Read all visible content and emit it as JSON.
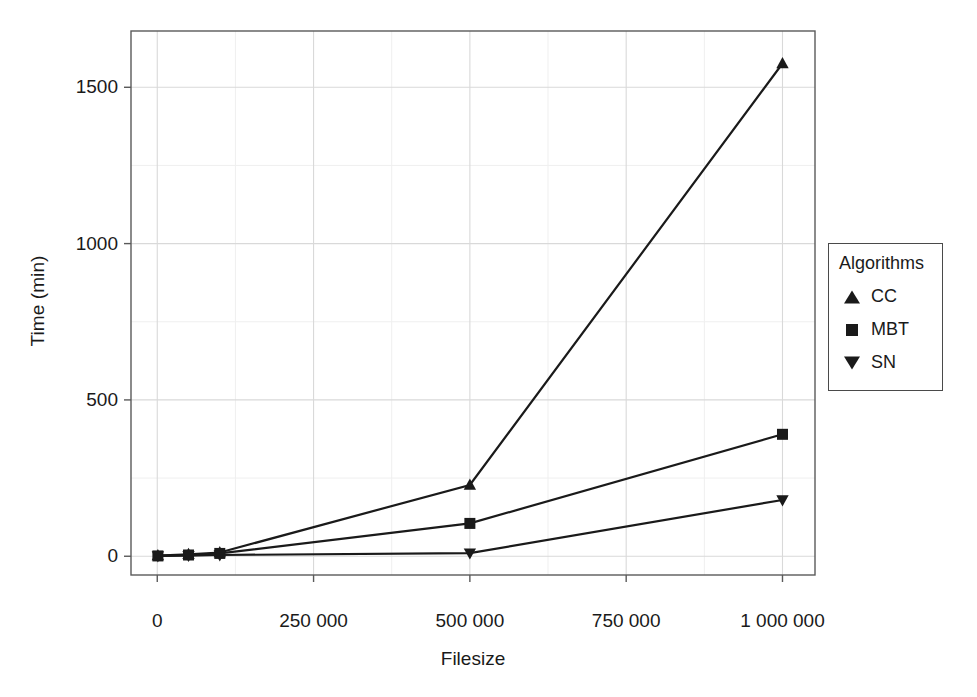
{
  "chart_data": {
    "type": "line",
    "title": "",
    "xlabel": "Filesize",
    "ylabel": "Time (min)",
    "xlim": [
      -42000,
      1052000
    ],
    "ylim": [
      -60,
      1680
    ],
    "xticks": [
      0,
      250000,
      500000,
      750000,
      1000000
    ],
    "xticklabels": [
      "0",
      "250 000",
      "500 000",
      "750 000",
      "1 000 000"
    ],
    "yticks": [
      0,
      500,
      1000,
      1500
    ],
    "yticklabels": [
      "0",
      "500",
      "1000",
      "1500"
    ],
    "grid": true,
    "grid_minor": true,
    "legend": {
      "title": "Algorithms",
      "position": "right",
      "entries": [
        {
          "label": "CC",
          "marker": "triangle-up-icon"
        },
        {
          "label": "MBT",
          "marker": "square-icon"
        },
        {
          "label": "SN",
          "marker": "triangle-down-icon"
        }
      ]
    },
    "x": [
      1000,
      50000,
      100000,
      500000,
      1000000
    ],
    "series": [
      {
        "name": "CC",
        "marker": "triangle-up",
        "color": "#1a1a1a",
        "values": [
          2,
          6,
          12,
          228,
          1576
        ]
      },
      {
        "name": "MBT",
        "marker": "square",
        "color": "#1a1a1a",
        "values": [
          1,
          4,
          9,
          105,
          390
        ]
      },
      {
        "name": "SN",
        "marker": "triangle-down",
        "color": "#1a1a1a",
        "values": [
          1,
          2,
          4,
          10,
          180
        ]
      }
    ]
  },
  "style": {
    "panel_background": "#ffffff",
    "panel_border": "#5a5a5a",
    "grid_major": "#d9d9d9",
    "grid_minor": "#efefef",
    "line_color": "#1a1a1a",
    "text_color": "#1a1a1a"
  }
}
